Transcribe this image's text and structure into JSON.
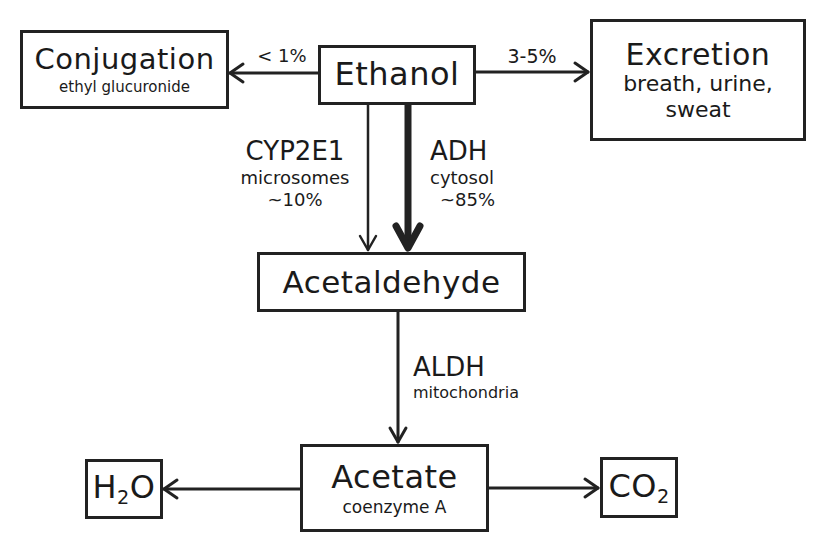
{
  "nodes": {
    "ethanol": {
      "title": "Ethanol"
    },
    "conjugation": {
      "title": "Conjugation",
      "subtitle": "ethyl glucuronide"
    },
    "excretion": {
      "title": "Excretion",
      "subtitle_line1": "breath, urine,",
      "subtitle_line2": "sweat"
    },
    "acetaldehyde": {
      "title": "Acetaldehyde"
    },
    "acetate": {
      "title": "Acetate",
      "subtitle": "coenzyme A"
    },
    "water": {
      "prefix": "H",
      "subscript": "2",
      "suffix": "O"
    },
    "co2": {
      "prefix": "CO",
      "subscript": "2"
    }
  },
  "edges": {
    "to_conjugation": {
      "label": "< 1%"
    },
    "to_excretion": {
      "label": "3-5%"
    },
    "cyp2e1": {
      "enzyme": "CYP2E1",
      "location": "microsomes",
      "percent": "~10%"
    },
    "adh": {
      "enzyme": "ADH",
      "location": "cytosol",
      "percent": "~85%"
    },
    "aldh": {
      "enzyme": "ALDH",
      "location": "mitochondria"
    }
  },
  "colors": {
    "line": "#222222",
    "background": "#ffffff"
  }
}
